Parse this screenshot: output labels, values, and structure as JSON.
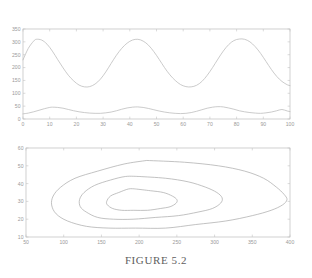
{
  "figure": {
    "caption": "FIGURE 5.2"
  },
  "chart_data": [
    {
      "type": "line",
      "id": "time-series-top",
      "title": "",
      "xlabel": "",
      "ylabel": "",
      "xlim": [
        0,
        100
      ],
      "ylim": [
        0,
        350
      ],
      "xticks": [
        0,
        10,
        20,
        30,
        40,
        50,
        60,
        70,
        80,
        90,
        100
      ],
      "yticks": [
        0,
        50,
        100,
        150,
        200,
        250,
        300,
        350
      ],
      "xtick_labels": [
        "0",
        "10",
        "20",
        "30",
        "40",
        "50",
        "60",
        "70",
        "80",
        "90",
        "100"
      ],
      "ytick_labels": [
        "0",
        "50",
        "100",
        "150",
        "200",
        "250",
        "300",
        "350"
      ],
      "grid": false,
      "legend": "none",
      "series": [
        {
          "name": "prey",
          "color": "#b9b9b9",
          "description": "large-amplitude oscillation, period about 26, peaks near 310, troughs near 125",
          "x": [
            0,
            2,
            4,
            5,
            7,
            9,
            11,
            13,
            15,
            17,
            19,
            21,
            23,
            25,
            27,
            29,
            31,
            33,
            35,
            37,
            39,
            41,
            43,
            45,
            47,
            49,
            51,
            53,
            55,
            57,
            59,
            61,
            63,
            65,
            67,
            69,
            71,
            73,
            75,
            77,
            79,
            81,
            83,
            85,
            87,
            89,
            91,
            93,
            95,
            97,
            99,
            100
          ],
          "y": [
            230,
            275,
            303,
            310,
            307,
            291,
            264,
            231,
            199,
            170,
            148,
            132,
            125,
            126,
            136,
            155,
            183,
            216,
            248,
            275,
            295,
            307,
            310,
            303,
            287,
            262,
            232,
            200,
            172,
            150,
            134,
            126,
            125,
            131,
            146,
            170,
            200,
            233,
            264,
            289,
            305,
            311,
            310,
            300,
            281,
            255,
            224,
            193,
            166,
            146,
            133,
            130
          ]
        },
        {
          "name": "predator",
          "color": "#b9b9b9",
          "description": "small-amplitude oscillation, same period, phase shifted, peaks near 47, troughs near 20",
          "x": [
            0,
            2,
            4,
            6,
            8,
            10,
            11,
            13,
            15,
            17,
            19,
            21,
            23,
            25,
            27,
            29,
            31,
            33,
            35,
            37,
            39,
            41,
            43,
            45,
            47,
            49,
            51,
            53,
            55,
            57,
            59,
            61,
            63,
            65,
            67,
            69,
            71,
            73,
            75,
            77,
            79,
            81,
            83,
            85,
            87,
            89,
            91,
            93,
            95,
            97,
            99,
            100
          ],
          "y": [
            20,
            23,
            28,
            34,
            40,
            45,
            46,
            45,
            42,
            37,
            32,
            28,
            25,
            23,
            22,
            22,
            24,
            27,
            32,
            38,
            43,
            46,
            47,
            45,
            41,
            36,
            31,
            27,
            24,
            22,
            21,
            22,
            25,
            30,
            36,
            42,
            46,
            48,
            47,
            43,
            38,
            32,
            28,
            25,
            23,
            22,
            24,
            27,
            32,
            37,
            31,
            29
          ]
        }
      ]
    },
    {
      "type": "line",
      "id": "phase-plane-bottom",
      "title": "",
      "xlabel": "",
      "ylabel": "",
      "xlim": [
        50,
        400
      ],
      "ylim": [
        10,
        60
      ],
      "xticks": [
        50,
        100,
        150,
        200,
        250,
        300,
        350,
        400
      ],
      "yticks": [
        10,
        20,
        30,
        40,
        50,
        60
      ],
      "xtick_labels": [
        "50",
        "100",
        "150",
        "200",
        "250",
        "300",
        "350",
        "400"
      ],
      "ytick_labels": [
        "10",
        "20",
        "30",
        "40",
        "50",
        "60"
      ],
      "grid": false,
      "legend": "none",
      "series": [
        {
          "name": "orbit-outer",
          "color": "#a8a8a8",
          "description": "outermost closed orbit with pointed right tip near x=395",
          "x": [
            210,
            260,
            305,
            340,
            365,
            382,
            392,
            396,
            390,
            375,
            350,
            315,
            275,
            235,
            195,
            160,
            130,
            105,
            90,
            84,
            86,
            96,
            115,
            145,
            180,
            210
          ],
          "y": [
            53,
            52,
            50,
            47,
            43,
            38,
            34,
            31,
            28,
            25,
            22,
            19,
            17,
            15,
            15,
            15,
            16,
            19,
            23,
            28,
            33,
            38,
            43,
            47,
            51,
            53
          ]
        },
        {
          "name": "orbit-middle",
          "color": "#a8a8a8",
          "description": "middle closed orbit",
          "x": [
            200,
            235,
            265,
            288,
            303,
            310,
            308,
            297,
            278,
            252,
            222,
            192,
            166,
            145,
            130,
            122,
            121,
            127,
            141,
            162,
            182,
            200
          ],
          "y": [
            44,
            43,
            41,
            38,
            35,
            32,
            29,
            26,
            24,
            22,
            21,
            20,
            20,
            21,
            24,
            27,
            31,
            35,
            39,
            42,
            44,
            44
          ]
        },
        {
          "name": "orbit-inner",
          "color": "#a8a8a8",
          "description": "innermost closed orbit",
          "x": [
            195,
            215,
            232,
            244,
            250,
            249,
            241,
            228,
            211,
            193,
            177,
            165,
            158,
            157,
            162,
            173,
            186,
            195
          ],
          "y": [
            37,
            36,
            35,
            33,
            31,
            29,
            27,
            26,
            25,
            25,
            25,
            26,
            28,
            30,
            33,
            35,
            37,
            37
          ]
        }
      ]
    }
  ]
}
